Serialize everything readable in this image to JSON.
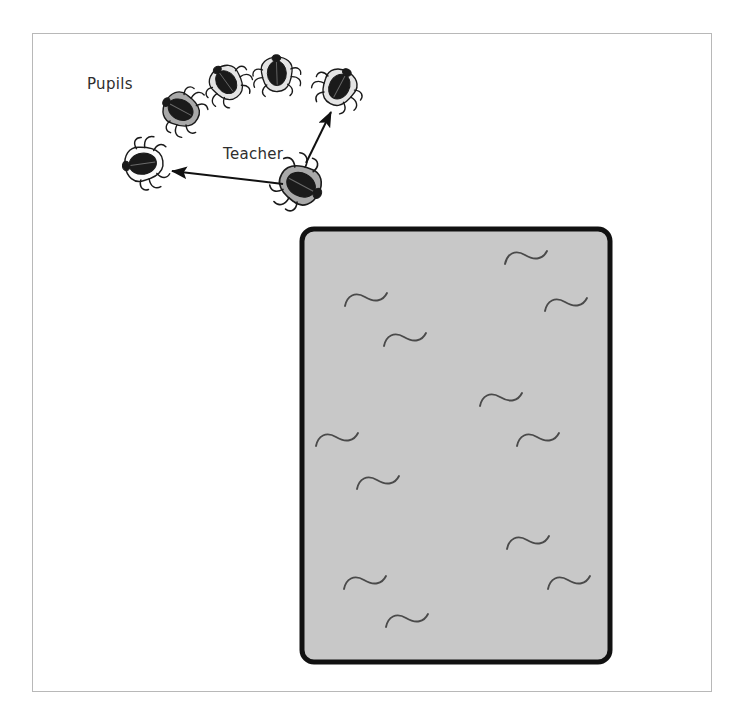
{
  "figure": {
    "title": "",
    "background_color": "#ffffff",
    "frame_color": "#b8b8b8"
  },
  "labels": {
    "pupils": "Pupils",
    "teacher": "Teacher"
  },
  "colors": {
    "beetle_body_dark": "#1a1a1a",
    "beetle_shell_gray": "#a9a9a9",
    "beetle_shell_light": "#f2f2f2",
    "beetle_outline": "#1a1a1a",
    "arena_fill": "#c8c8c8",
    "arena_border": "#111111",
    "squiggle_stroke": "#4a4a4a",
    "arrow_color": "#111111",
    "label_text": "#2e2e2e"
  },
  "arena": {
    "name": "arena-box",
    "x": 302,
    "y": 229,
    "width": 308,
    "height": 433,
    "corner_radius": 12,
    "border_width": 5,
    "fill": "#c8c8c8",
    "border": "#111111"
  },
  "beetles": [
    {
      "id": "pupil-1",
      "role": "pupil",
      "cx": 185,
      "cy": 112,
      "rotation": -62,
      "shade": "gray",
      "scale": 1.0
    },
    {
      "id": "pupil-2",
      "role": "pupil",
      "cx": 229,
      "cy": 86,
      "rotation": -36,
      "shade": "light",
      "scale": 0.95
    },
    {
      "id": "pupil-3",
      "role": "pupil",
      "cx": 277,
      "cy": 78,
      "rotation": -2,
      "shade": "light",
      "scale": 0.95
    },
    {
      "id": "pupil-4",
      "role": "pupil",
      "cx": 337,
      "cy": 91,
      "rotation": 28,
      "shade": "light",
      "scale": 1.0
    },
    {
      "id": "pupil-5",
      "role": "pupil",
      "cx": 148,
      "cy": 163,
      "rotation": -98,
      "shade": "white",
      "scale": 1.05
    },
    {
      "id": "teacher",
      "role": "teacher",
      "cx": 296,
      "cy": 182,
      "rotation": 118,
      "shade": "gray",
      "scale": 1.15
    }
  ],
  "arrows": [
    {
      "id": "arrow-teacher-to-left-pupil",
      "from_x": 283,
      "from_y": 184,
      "to_x": 172,
      "to_y": 171,
      "target": "pupil-5"
    },
    {
      "id": "arrow-teacher-to-right-pupil",
      "from_x": 306,
      "from_y": 163,
      "to_x": 331,
      "to_y": 112,
      "target": "pupil-4"
    }
  ],
  "squiggles": [
    {
      "id": "squiggle-1",
      "x": 345,
      "y": 300,
      "scale": 1.0,
      "rotation": 0
    },
    {
      "id": "squiggle-2",
      "x": 384,
      "y": 340,
      "scale": 1.0,
      "rotation": 0
    },
    {
      "id": "squiggle-3",
      "x": 505,
      "y": 258,
      "scale": 1.0,
      "rotation": 0
    },
    {
      "id": "squiggle-4",
      "x": 545,
      "y": 305,
      "scale": 1.0,
      "rotation": 0
    },
    {
      "id": "squiggle-5",
      "x": 480,
      "y": 400,
      "scale": 1.0,
      "rotation": 0
    },
    {
      "id": "squiggle-6",
      "x": 316,
      "y": 440,
      "scale": 1.0,
      "rotation": 0
    },
    {
      "id": "squiggle-7",
      "x": 517,
      "y": 440,
      "scale": 1.0,
      "rotation": 0
    },
    {
      "id": "squiggle-8",
      "x": 357,
      "y": 483,
      "scale": 1.0,
      "rotation": 0
    },
    {
      "id": "squiggle-9",
      "x": 507,
      "y": 543,
      "scale": 1.0,
      "rotation": 0
    },
    {
      "id": "squiggle-10",
      "x": 344,
      "y": 583,
      "scale": 1.0,
      "rotation": 0
    },
    {
      "id": "squiggle-11",
      "x": 548,
      "y": 583,
      "scale": 1.0,
      "rotation": 0
    },
    {
      "id": "squiggle-12",
      "x": 386,
      "y": 621,
      "scale": 1.0,
      "rotation": 0
    }
  ],
  "counts": {
    "pupils": 5,
    "teachers": 1,
    "squiggles": 12,
    "arrows": 2
  }
}
